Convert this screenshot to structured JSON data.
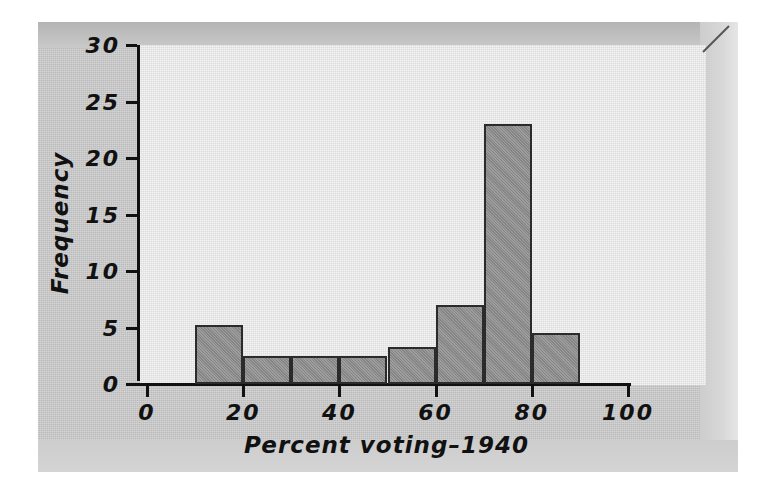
{
  "figure": {
    "axis_title_x": "Percent voting–1940",
    "axis_title_y": "Frequency",
    "bar_fill": "#8f8f8f",
    "bar_edge": "#2b2b2b",
    "panel_bg": "#e9e9e9",
    "page_bg": "#c9c9c9"
  },
  "chart_data": {
    "type": "bar",
    "title": "",
    "subtitle": "",
    "xlabel": "Percent voting–1940",
    "ylabel": "Frequency",
    "xlim": [
      0,
      100
    ],
    "ylim": [
      0,
      30
    ],
    "grid": false,
    "legend": null,
    "bin_width": 10,
    "bin_edges": [
      10,
      20,
      30,
      40,
      50,
      60,
      70,
      80,
      90
    ],
    "categories": [
      "10-20",
      "20-30",
      "30-40",
      "40-50",
      "50-60",
      "60-70",
      "70-80",
      "80-90"
    ],
    "values": [
      5.2,
      2.5,
      2.5,
      2.5,
      3.3,
      7,
      23,
      4.5
    ],
    "xticks": [
      0,
      20,
      40,
      60,
      80,
      100
    ],
    "xtick_labels": [
      "0",
      "20",
      "40",
      "60",
      "80",
      "100"
    ],
    "yticks": [
      0,
      5,
      10,
      15,
      20,
      25,
      30
    ],
    "ytick_labels": [
      "0",
      "5",
      "10",
      "15",
      "20",
      "25",
      "30"
    ]
  }
}
